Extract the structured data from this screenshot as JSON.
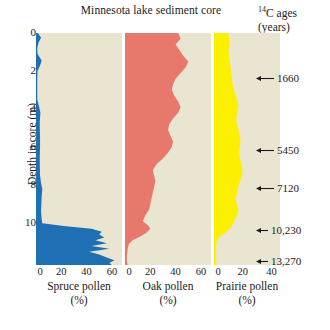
{
  "title": "Minnesota lake sediment core",
  "ages_header": {
    "sup": "14",
    "main": "C ages",
    "unit": "(years)"
  },
  "depth_axis": {
    "label": "Depth in core (m)",
    "ticks": [
      "0",
      "2",
      "4",
      "6",
      "8",
      "10"
    ],
    "tick_values": [
      0,
      2,
      4,
      6,
      8,
      10
    ],
    "range": [
      0,
      12.2
    ]
  },
  "panels": [
    {
      "name": "spruce",
      "caption_line1": "Spruce pollen",
      "caption_line2": "(%)",
      "color": "#1f6fb5",
      "xticks": [
        "0",
        "20",
        "40",
        "60"
      ],
      "xtick_values": [
        0,
        20,
        40,
        60
      ],
      "xmax": 68
    },
    {
      "name": "oak",
      "caption_line1": "Oak pollen",
      "caption_line2": "(%)",
      "color": "#e8786c",
      "xticks": [
        "0",
        "20",
        "40",
        "60"
      ],
      "xtick_values": [
        0,
        20,
        40,
        60
      ],
      "xmax": 68
    },
    {
      "name": "prairie",
      "caption_line1": "Prairie pollen",
      "caption_line2": "(%)",
      "color": "#fcef00",
      "xticks": [
        "0",
        "20",
        "40"
      ],
      "xtick_values": [
        0,
        20,
        40
      ],
      "xmax": 46
    }
  ],
  "carbon_ages": [
    {
      "label": "1660",
      "depth": 2.35
    },
    {
      "label": "5450",
      "depth": 6.15
    },
    {
      "label": "7120",
      "depth": 8.15
    },
    {
      "label": "10,230",
      "depth": 10.35
    },
    {
      "label": "13,270",
      "depth": 12.0
    }
  ],
  "chart_data": {
    "type": "area",
    "title": "Minnesota lake sediment core",
    "xlabel": "Pollen (%)",
    "ylabel": "Depth in core (m)",
    "ylim": [
      0,
      12.2
    ],
    "y_inverted": true,
    "grid": false,
    "legend": "none",
    "series": [
      {
        "name": "Spruce pollen",
        "color": "#1f6fb5",
        "xlim": [
          0,
          68
        ],
        "xticks": [
          0,
          20,
          40,
          60
        ],
        "points": [
          [
            0.0,
            1.5
          ],
          [
            0.25,
            4.0
          ],
          [
            0.5,
            2.0
          ],
          [
            0.8,
            1.0
          ],
          [
            1.1,
            1.2
          ],
          [
            1.45,
            4.5
          ],
          [
            1.75,
            3.0
          ],
          [
            2.0,
            1.2
          ],
          [
            2.5,
            1.0
          ],
          [
            3.0,
            1.0
          ],
          [
            3.5,
            1.0
          ],
          [
            3.9,
            2.5
          ],
          [
            4.2,
            3.5
          ],
          [
            4.6,
            3.0
          ],
          [
            5.0,
            3.0
          ],
          [
            5.5,
            3.2
          ],
          [
            6.0,
            3.2
          ],
          [
            6.5,
            3.0
          ],
          [
            7.0,
            3.0
          ],
          [
            7.5,
            3.2
          ],
          [
            7.9,
            4.0
          ],
          [
            8.2,
            5.0
          ],
          [
            8.6,
            4.5
          ],
          [
            9.0,
            4.2
          ],
          [
            9.4,
            4.0
          ],
          [
            9.8,
            4.5
          ],
          [
            10.0,
            5.0
          ],
          [
            10.15,
            22.0
          ],
          [
            10.3,
            44.0
          ],
          [
            10.45,
            52.0
          ],
          [
            10.6,
            50.0
          ],
          [
            10.75,
            54.0
          ],
          [
            10.9,
            47.0
          ],
          [
            11.05,
            56.0
          ],
          [
            11.2,
            44.0
          ],
          [
            11.35,
            58.0
          ],
          [
            11.5,
            42.0
          ],
          [
            11.65,
            50.0
          ],
          [
            11.8,
            56.0
          ],
          [
            11.95,
            62.0
          ],
          [
            12.1,
            58.0
          ],
          [
            12.2,
            60.0
          ]
        ]
      },
      {
        "name": "Oak pollen",
        "color": "#e8786c",
        "xlim": [
          0,
          68
        ],
        "xticks": [
          0,
          20,
          40,
          60
        ],
        "points": [
          [
            0.0,
            42.0
          ],
          [
            0.3,
            44.0
          ],
          [
            0.6,
            40.0
          ],
          [
            0.9,
            43.0
          ],
          [
            1.2,
            46.0
          ],
          [
            1.5,
            50.0
          ],
          [
            1.8,
            48.0
          ],
          [
            2.1,
            44.0
          ],
          [
            2.4,
            40.0
          ],
          [
            2.7,
            38.0
          ],
          [
            3.0,
            37.0
          ],
          [
            3.3,
            39.0
          ],
          [
            3.6,
            42.0
          ],
          [
            3.9,
            44.0
          ],
          [
            4.2,
            42.0
          ],
          [
            4.5,
            38.0
          ],
          [
            4.8,
            35.0
          ],
          [
            5.1,
            34.0
          ],
          [
            5.4,
            36.0
          ],
          [
            5.7,
            38.0
          ],
          [
            6.0,
            37.0
          ],
          [
            6.3,
            34.0
          ],
          [
            6.6,
            30.0
          ],
          [
            6.9,
            25.0
          ],
          [
            7.2,
            22.0
          ],
          [
            7.5,
            23.0
          ],
          [
            7.8,
            24.0
          ],
          [
            8.1,
            23.0
          ],
          [
            8.4,
            22.0
          ],
          [
            8.7,
            21.0
          ],
          [
            9.0,
            20.0
          ],
          [
            9.3,
            19.0
          ],
          [
            9.6,
            16.0
          ],
          [
            9.9,
            14.0
          ],
          [
            10.1,
            18.0
          ],
          [
            10.3,
            20.0
          ],
          [
            10.5,
            17.0
          ],
          [
            10.7,
            12.0
          ],
          [
            10.9,
            6.0
          ],
          [
            11.1,
            3.0
          ],
          [
            11.4,
            2.0
          ],
          [
            11.7,
            1.5
          ],
          [
            12.0,
            1.5
          ],
          [
            12.2,
            2.0
          ]
        ]
      },
      {
        "name": "Prairie pollen",
        "color": "#fcef00",
        "xlim": [
          0,
          46
        ],
        "xticks": [
          0,
          20,
          40
        ],
        "points": [
          [
            0.0,
            10.0
          ],
          [
            0.3,
            10.5
          ],
          [
            0.6,
            11.0
          ],
          [
            0.9,
            10.0
          ],
          [
            1.2,
            10.5
          ],
          [
            1.5,
            11.0
          ],
          [
            1.8,
            11.5
          ],
          [
            2.1,
            12.0
          ],
          [
            2.4,
            12.5
          ],
          [
            2.7,
            13.0
          ],
          [
            3.0,
            14.0
          ],
          [
            3.3,
            15.0
          ],
          [
            3.6,
            16.5
          ],
          [
            3.9,
            17.0
          ],
          [
            4.2,
            16.0
          ],
          [
            4.5,
            15.5
          ],
          [
            4.8,
            16.0
          ],
          [
            5.1,
            17.0
          ],
          [
            5.4,
            18.0
          ],
          [
            5.7,
            18.5
          ],
          [
            6.0,
            18.0
          ],
          [
            6.3,
            17.5
          ],
          [
            6.6,
            18.0
          ],
          [
            6.9,
            19.0
          ],
          [
            7.2,
            20.0
          ],
          [
            7.5,
            19.5
          ],
          [
            7.8,
            18.0
          ],
          [
            8.1,
            17.0
          ],
          [
            8.4,
            16.0
          ],
          [
            8.7,
            15.0
          ],
          [
            9.0,
            16.0
          ],
          [
            9.3,
            17.0
          ],
          [
            9.6,
            16.0
          ],
          [
            9.9,
            14.0
          ],
          [
            10.2,
            12.0
          ],
          [
            10.5,
            8.0
          ],
          [
            10.7,
            4.0
          ],
          [
            10.9,
            2.0
          ],
          [
            11.2,
            1.5
          ],
          [
            11.5,
            1.5
          ],
          [
            11.8,
            1.5
          ],
          [
            12.0,
            1.5
          ],
          [
            12.2,
            2.0
          ]
        ]
      }
    ],
    "annotations": [
      {
        "text": "1660",
        "depth": 2.35
      },
      {
        "text": "5450",
        "depth": 6.15
      },
      {
        "text": "7120",
        "depth": 8.15
      },
      {
        "text": "10,230",
        "depth": 10.35
      },
      {
        "text": "13,270",
        "depth": 12.0
      }
    ]
  }
}
